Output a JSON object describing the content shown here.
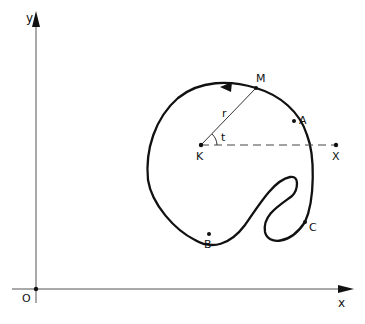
{
  "diagram": {
    "type": "parametric closed curve in polar form around point K",
    "axes": {
      "x_label": "x",
      "y_label": "y",
      "origin_label": "O"
    },
    "points": {
      "center": "K",
      "ray_end": "X",
      "curve_point": "M",
      "A": "A",
      "B": "B",
      "C": "C"
    },
    "annotations": {
      "radius_label": "r",
      "angle_label": "t"
    },
    "colors": {
      "stroke": "#111111",
      "background": "#ffffff"
    }
  }
}
